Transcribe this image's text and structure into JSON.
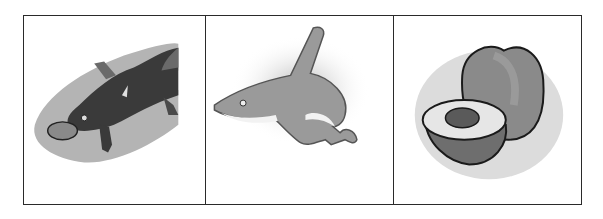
{
  "panels": [
    {
      "subject": "platypus",
      "description": "grayscale clip-art of a platypus on a gray blob background"
    },
    {
      "subject": "shark",
      "description": "grayscale clip-art of a shark with soft shadow"
    },
    {
      "subject": "peach",
      "description": "grayscale clip-art of a whole peach and a halved peach with pit"
    }
  ],
  "colors": {
    "border": "#2a2a2a",
    "background": "#ffffff",
    "blob": "#b4b4b4",
    "platypus_body": "#3a3a3a",
    "shark_body": "#9a9a9a",
    "peach_body": "#8a8a8a"
  }
}
